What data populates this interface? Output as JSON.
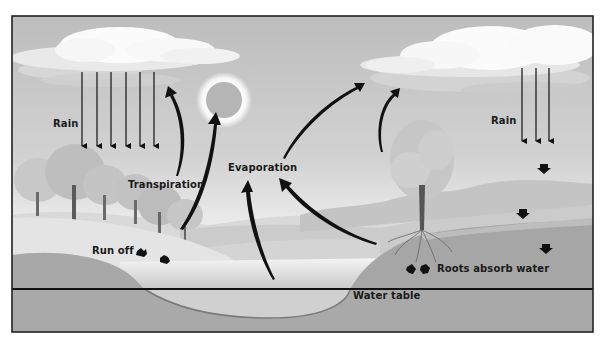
{
  "diagram": {
    "labels": {
      "rain_left": "Rain",
      "rain_right": "Rain",
      "transpiration": "Transpiration",
      "evaporation": "Evaporation",
      "run_off": "Run off",
      "roots_absorb_water": "Roots absorb water",
      "water_table": "Water table"
    },
    "elements": {
      "clouds": 2,
      "sun": 1,
      "rain_arrows_left": 6,
      "rain_arrows_right": 3,
      "evaporation_arrows": 4,
      "transpiration_arrows": 2,
      "runoff_arrows": 2,
      "root_absorb_arrows": 2,
      "infiltration_arrows": 3
    },
    "colors": {
      "sky": "#c9c9c9",
      "sky_light": "#f2f2f2",
      "cloud": "#f7f7f7",
      "ground": "#a9a9a9",
      "hill_light": "#dcdcdc",
      "water": "#d8d8d8",
      "arrow": "#111111",
      "frame": "#222222"
    }
  }
}
